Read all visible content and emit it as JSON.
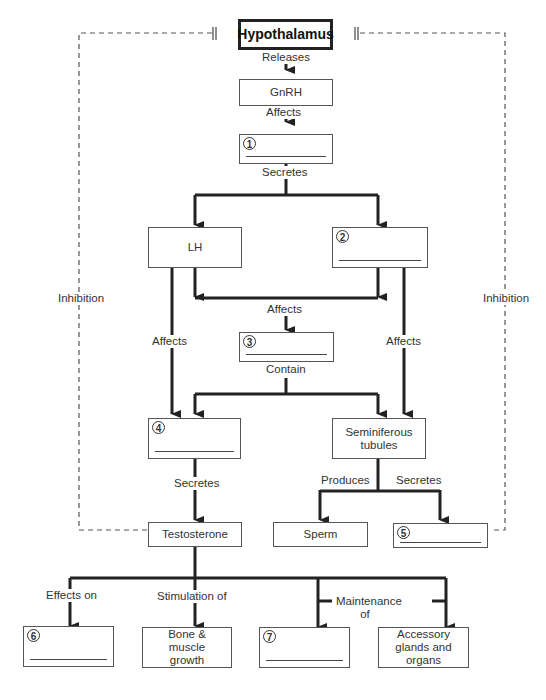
{
  "diagram": {
    "nodes": {
      "hypothalamus": "Hypothalamus",
      "gnrh": "GnRH",
      "blank1": {
        "number": "1",
        "answer": ""
      },
      "lh": "LH",
      "blank2": {
        "number": "2",
        "answer": ""
      },
      "blank3": {
        "number": "3",
        "answer": ""
      },
      "blank4": {
        "number": "4",
        "answer": ""
      },
      "seminiferous": "Seminiferous tubules",
      "testosterone": "Testosterone",
      "sperm": "Sperm",
      "blank5": {
        "number": "5",
        "answer": ""
      },
      "blank6": {
        "number": "6",
        "answer": ""
      },
      "bone": "Bone & muscle growth",
      "blank7": {
        "number": "7",
        "answer": ""
      },
      "accessory": "Accessory glands and organs"
    },
    "edge_labels": {
      "releases": "Releases",
      "affects_gnrh": "Affects",
      "secretes_1": "Secretes",
      "affects_3": "Affects",
      "affects_left": "Affects",
      "affects_right": "Affects",
      "contain": "Contain",
      "secretes_4": "Secretes",
      "produces": "Produces",
      "secretes_semi": "Secretes",
      "effects_on": "Effects on",
      "stimulation_of": "Stimulation of",
      "maintenance_of": "Maintenance of",
      "inhibition_left": "Inhibition",
      "inhibition_right": "Inhibition"
    },
    "colors": {
      "line": "#222222",
      "dashed": "#555555",
      "box_border": "#555555"
    }
  }
}
